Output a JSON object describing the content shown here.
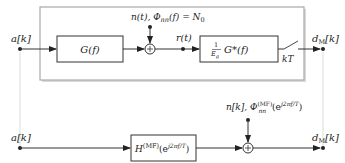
{
  "diagram": {
    "type": "signal-flow block diagram",
    "top_system": {
      "input_label": "a[k]",
      "filter_tx": "G(f)",
      "noise_label_main": "n(t), Φ",
      "noise_label_sub": "nn",
      "noise_label_tail": "(f) = N",
      "noise_label_tail_sub": "0",
      "received_label": "r(t)",
      "matched_filter_frac_num": "1",
      "matched_filter_frac_den": "E",
      "matched_filter_frac_den_sub": "g",
      "matched_filter_body": "G*(f)",
      "sampler_label": "kT",
      "output_label_main": "d",
      "output_label_sub": "M",
      "output_label_tail": "[k]",
      "adder_symbol": "+"
    },
    "bottom_system": {
      "input_label": "a[k]",
      "filter_main": "H",
      "filter_sup": "(MF)",
      "filter_arg": "(e",
      "filter_arg_sup": "j2πf/T",
      "filter_close": ")",
      "noise_label_main": "n[k], Φ",
      "noise_label_sup": "(MF)",
      "noise_label_sub": "nn",
      "noise_label_arg": "(e",
      "noise_label_arg_sup": "j2πf/T",
      "noise_label_close": ")",
      "output_label_main": "d",
      "output_label_sub": "M",
      "output_label_tail": "[k]",
      "adder_symbol": "+"
    },
    "colors": {
      "line": "#333333",
      "frame": "#a8a8a8",
      "frame_shadow": "#d6d6d6",
      "connector": "#dcdcdc"
    }
  }
}
